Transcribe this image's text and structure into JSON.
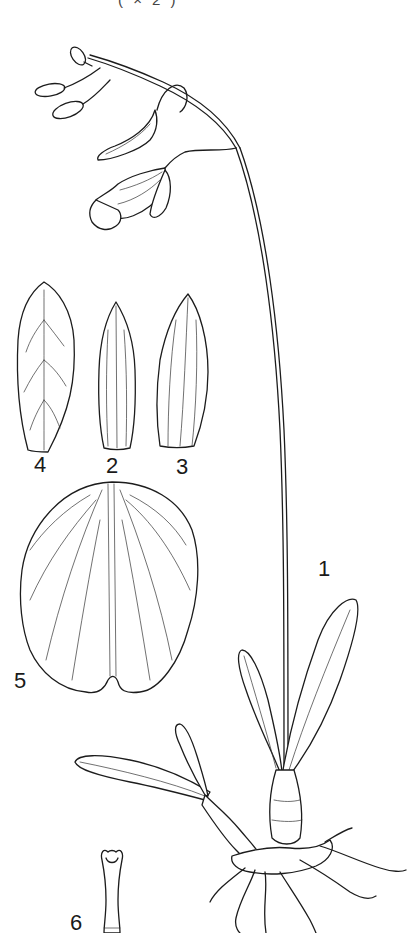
{
  "plate": {
    "caption": "( × 2 )",
    "labels": {
      "habit": "1",
      "dorsal_sepal": "2",
      "lateral_sepal": "3",
      "petal": "4",
      "lip": "5",
      "column": "6"
    },
    "colors": {
      "background": "#ffffff",
      "ink": "#1c1c1c"
    }
  }
}
